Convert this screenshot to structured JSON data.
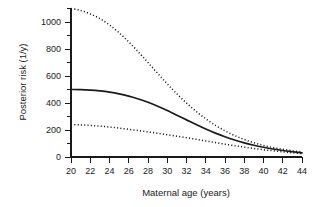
{
  "chart_data": {
    "type": "line",
    "title": "",
    "subtitle": "",
    "xlabel": "Maternal age (years)",
    "ylabel": "Posterior risk (1/y)",
    "xlim": [
      19,
      45
    ],
    "ylim": [
      0,
      1100
    ],
    "xticks": [
      20,
      22,
      24,
      26,
      28,
      30,
      32,
      34,
      36,
      38,
      40,
      42,
      44
    ],
    "xtick_labels": [
      "20",
      "22",
      "24",
      "26",
      "28",
      "30",
      "32",
      "34",
      "36",
      "38",
      "40",
      "42",
      "44"
    ],
    "yticks": [
      0,
      200,
      400,
      600,
      800,
      1000
    ],
    "ytick_labels": [
      "0",
      "200",
      "400",
      "600",
      "800",
      "1000"
    ],
    "y_minor_ticks": [
      100,
      300,
      500,
      700,
      900,
      1100
    ],
    "grid": false,
    "legend": null,
    "x": [
      20,
      21,
      22,
      23,
      24,
      25,
      26,
      27,
      28,
      29,
      30,
      31,
      32,
      33,
      34,
      35,
      36,
      37,
      38,
      39,
      40,
      41,
      42,
      43,
      44
    ],
    "series": [
      {
        "name": "upper confidence bound",
        "style": "dotted",
        "color": "#1a1a1a",
        "values": [
          1100,
          1085,
          1060,
          1025,
          978,
          920,
          852,
          778,
          700,
          620,
          542,
          468,
          400,
          338,
          283,
          235,
          194,
          159,
          130,
          106,
          86,
          70,
          57,
          46,
          37
        ]
      },
      {
        "name": "posterior risk (point estimate)",
        "style": "solid",
        "color": "#1a1a1a",
        "values": [
          500,
          499,
          496,
          490,
          481,
          468,
          451,
          430,
          405,
          376,
          344,
          310,
          275,
          240,
          207,
          177,
          150,
          126,
          105,
          87,
          72,
          59,
          48,
          39,
          31
        ]
      },
      {
        "name": "lower confidence bound",
        "style": "dotted",
        "color": "#1a1a1a",
        "values": [
          240,
          238,
          234,
          229,
          222,
          214,
          205,
          196,
          186,
          176,
          165,
          154,
          143,
          131,
          119,
          107,
          95,
          84,
          73,
          63,
          54,
          46,
          38,
          31,
          25
        ]
      }
    ]
  },
  "colors": {
    "foreground": "#1a1a1a",
    "background": "#ffffff"
  }
}
